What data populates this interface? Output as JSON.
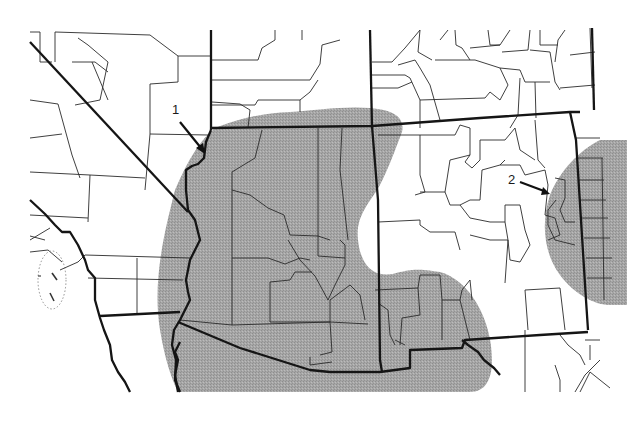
{
  "map": {
    "title": "",
    "region": "Southwestern United States",
    "shading_color": "#9f9f9f",
    "background_color": "#ffffff",
    "line_color": "#1a1a1a",
    "legend": [],
    "markers": [
      {
        "id": "1",
        "label": "1",
        "label_x": 172,
        "label_y": 108,
        "arrow_from": [
          180,
          122
        ],
        "arrow_to": [
          204,
          152
        ]
      },
      {
        "id": "2",
        "label": "2",
        "label_x": 508,
        "label_y": 176,
        "arrow_from": [
          520,
          182
        ],
        "arrow_to": [
          548,
          192
        ]
      }
    ],
    "regions": {
      "shaded_range": "Gray stippled distribution area covering Arizona, southeastern California, southern Nevada/Utah edge, southwestern New Mexico, and eastern New Mexico/west Texas border",
      "unshaded": "Northern Utah/Colorado counties, California/Nevada west, central New Mexico"
    }
  }
}
